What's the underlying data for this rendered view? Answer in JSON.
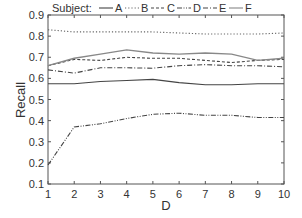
{
  "chart_data": {
    "type": "line",
    "title": "",
    "xlabel": "D",
    "ylabel": "Recall",
    "x": [
      1,
      2,
      3,
      4,
      5,
      6,
      7,
      8,
      9,
      10
    ],
    "xlim": [
      1,
      10
    ],
    "ylim": [
      0.1,
      0.9
    ],
    "xticks": [
      "1",
      "2",
      "3",
      "4",
      "5",
      "6",
      "7",
      "8",
      "9",
      "10"
    ],
    "yticks": [
      "0.1",
      "0.2",
      "0.3",
      "0.4",
      "0.5",
      "0.6",
      "0.7",
      "0.8",
      "0.9"
    ],
    "grid": false,
    "legend_title": "Subject:",
    "legend_position": "top",
    "series": [
      {
        "name": "A",
        "style": "solid",
        "color": "#444444",
        "values": [
          0.575,
          0.575,
          0.585,
          0.59,
          0.595,
          0.58,
          0.57,
          0.57,
          0.575,
          0.575
        ]
      },
      {
        "name": "B",
        "style": "dotted",
        "color": "#666666",
        "values": [
          0.83,
          0.82,
          0.82,
          0.82,
          0.82,
          0.815,
          0.81,
          0.81,
          0.81,
          0.815
        ]
      },
      {
        "name": "C",
        "style": "dashed",
        "color": "#444444",
        "values": [
          0.66,
          0.69,
          0.685,
          0.7,
          0.695,
          0.695,
          0.685,
          0.675,
          0.685,
          0.69
        ]
      },
      {
        "name": "D",
        "style": "dash-dot-dot",
        "color": "#444444",
        "values": [
          0.19,
          0.37,
          0.385,
          0.41,
          0.43,
          0.435,
          0.425,
          0.425,
          0.415,
          0.415
        ]
      },
      {
        "name": "E",
        "style": "dash-dot",
        "color": "#444444",
        "values": [
          0.64,
          0.625,
          0.65,
          0.65,
          0.648,
          0.66,
          0.665,
          0.66,
          0.66,
          0.655
        ]
      },
      {
        "name": "F",
        "style": "solid",
        "color": "#888888",
        "values": [
          0.66,
          0.695,
          0.715,
          0.735,
          0.72,
          0.715,
          0.72,
          0.715,
          0.685,
          0.695
        ]
      }
    ]
  }
}
